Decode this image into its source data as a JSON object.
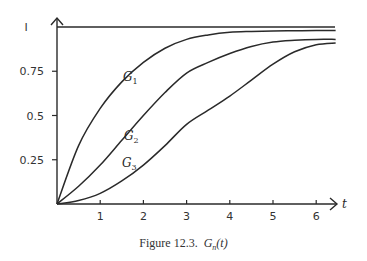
{
  "chart_data": {
    "type": "line",
    "title": "",
    "caption": "Figure 12.3.",
    "caption_math": "G_n(t)",
    "xlabel": "t",
    "ylabel": "",
    "xlim": [
      0,
      6.5
    ],
    "ylim": [
      0,
      1
    ],
    "xticks": [
      1,
      2,
      3,
      4,
      5,
      6
    ],
    "xtick_labels": [
      "1",
      "2",
      "3",
      "4",
      "5",
      "6"
    ],
    "yticks": [
      0.25,
      0.5,
      0.75,
      1
    ],
    "ytick_labels": [
      "0.25",
      "0.5",
      "0.75",
      "I"
    ],
    "grid": false,
    "legend": "inline labels",
    "reference_line": {
      "y": 1,
      "style": "solid"
    },
    "x": [
      0,
      0.5,
      1,
      1.5,
      2,
      2.5,
      3,
      3.5,
      4,
      4.5,
      5,
      5.5,
      6,
      6.45
    ],
    "series": [
      {
        "name": "G1",
        "label_base": "G",
        "label_sub": "1",
        "values": [
          0,
          0.33,
          0.54,
          0.69,
          0.8,
          0.88,
          0.93,
          0.955,
          0.97,
          0.975,
          0.978,
          0.979,
          0.98,
          0.98
        ]
      },
      {
        "name": "G2",
        "label_base": "G",
        "label_sub": "2",
        "values": [
          0,
          0.1,
          0.22,
          0.36,
          0.5,
          0.63,
          0.74,
          0.8,
          0.85,
          0.89,
          0.915,
          0.925,
          0.93,
          0.93
        ]
      },
      {
        "name": "G3",
        "label_base": "G",
        "label_sub": "3",
        "values": [
          0,
          0.02,
          0.06,
          0.13,
          0.22,
          0.33,
          0.45,
          0.53,
          0.61,
          0.7,
          0.79,
          0.86,
          0.9,
          0.91
        ]
      }
    ]
  }
}
